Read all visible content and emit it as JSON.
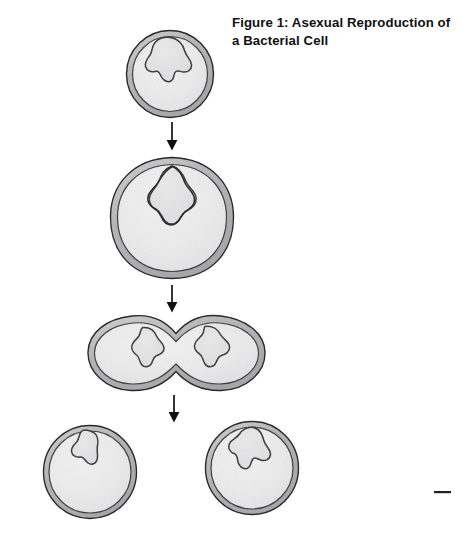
{
  "figure": {
    "caption_lines": [
      "Figure 1: Asexual Reproduction of",
      "a Bacterial Cell"
    ],
    "caption_full": "Figure 1: Asexual Reproduction of a Bacterial Cell",
    "background_color": "#ffffff",
    "ink_color": "#1a1a1a",
    "cytoplasm_color": "#ececed",
    "wall_band_color": "#b9b9bb",
    "nucleoid_color": "#e2e2e3",
    "width": 466,
    "height": 550
  },
  "stages": [
    {
      "id": "stage-1",
      "name": "parent-cell",
      "label": "Parent bacterial cell with single nucleoid",
      "shape": "circle",
      "center_x": 170,
      "center_y": 74,
      "radius": 44,
      "nucleoid_count": 1
    },
    {
      "id": "stage-2",
      "name": "dna-replication-cell",
      "label": "Enlarged cell with replicating DNA",
      "shape": "rounded-flattened-circle",
      "center_x": 172,
      "center_y": 217,
      "radius": 62,
      "nucleoid_count": 2
    },
    {
      "id": "stage-3",
      "name": "constricting-cell",
      "label": "Cell constricting into two compartments",
      "shape": "dumbbell",
      "center_x": 176,
      "center_y": 352,
      "radius": 88,
      "nucleoid_count": 2
    },
    {
      "id": "stage-4-left",
      "name": "daughter-cell-left",
      "label": "Daughter cell one",
      "shape": "circle",
      "center_x": 90,
      "center_y": 472,
      "radius": 47,
      "nucleoid_count": 1
    },
    {
      "id": "stage-4-right",
      "name": "daughter-cell-right",
      "label": "Daughter cell two",
      "shape": "circle",
      "center_x": 252,
      "center_y": 468,
      "radius": 47,
      "nucleoid_count": 1
    }
  ],
  "arrows": [
    {
      "id": "arrow-1",
      "name": "arrow-stage1-to-stage2",
      "x": 172,
      "y_start": 122,
      "y_end": 150
    },
    {
      "id": "arrow-2",
      "name": "arrow-stage2-to-stage3",
      "x": 172,
      "y_start": 285,
      "y_end": 313
    },
    {
      "id": "arrow-3",
      "name": "arrow-stage3-to-stage4",
      "x": 174,
      "y_start": 395,
      "y_end": 423
    }
  ],
  "marks": [
    {
      "id": "mark-1",
      "name": "dash-mark",
      "x": 434,
      "y": 492,
      "width": 17,
      "height": 2
    }
  ]
}
